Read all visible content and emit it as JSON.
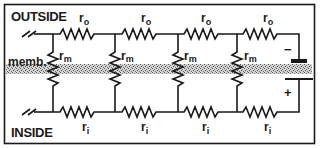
{
  "diagram": {
    "labels": {
      "outside": "OUTSIDE",
      "inside": "INSIDE",
      "membrane": "memb."
    },
    "resistors": {
      "outside": {
        "symbol": "r",
        "subscript": "o"
      },
      "inside": {
        "symbol": "r",
        "subscript": "i"
      },
      "membrane": {
        "symbol": "r",
        "subscript": "m"
      }
    },
    "battery": {
      "negative": "−",
      "positive": "+"
    },
    "nodes_x": [
      53,
      115,
      178,
      237
    ],
    "battery_x": 299,
    "colors": {
      "ink": "#1a1a1a",
      "membrane": "#9a9a9a",
      "background": "#ffffff"
    }
  }
}
